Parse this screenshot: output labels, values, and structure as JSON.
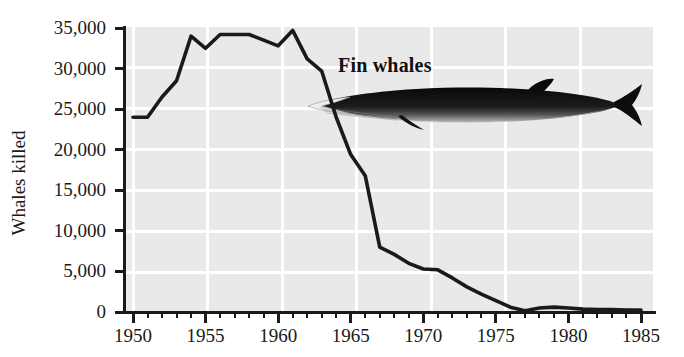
{
  "chart_data": {
    "type": "line",
    "title": "",
    "series_label": "Fin whales",
    "xlabel": "",
    "ylabel": "Whales killed",
    "xlim": [
      1949,
      1985.3
    ],
    "ylim": [
      0,
      35000
    ],
    "grid": true,
    "legend_position": "inline-annotation",
    "x_major_ticks": [
      1950,
      1955,
      1960,
      1965,
      1970,
      1975,
      1980,
      1985
    ],
    "x_tick_labels": [
      "1950",
      "1955",
      "1960",
      "1965",
      "1970",
      "1975",
      "1980",
      "1985"
    ],
    "x_minor_tick_interval": 1,
    "y_ticks": [
      0,
      5000,
      10000,
      15000,
      20000,
      25000,
      30000,
      35000
    ],
    "y_tick_labels": [
      "0",
      "5,000",
      "10,000",
      "15,000",
      "20,000",
      "25,000",
      "30,000",
      "35,000"
    ],
    "x": [
      1950,
      1951,
      1952,
      1953,
      1954,
      1955,
      1956,
      1957,
      1958,
      1959,
      1960,
      1961,
      1962,
      1963,
      1964,
      1965,
      1966,
      1967,
      1968,
      1969,
      1970,
      1971,
      1972,
      1973,
      1974,
      1975,
      1976,
      1977,
      1978,
      1979,
      1980,
      1981,
      1982,
      1983,
      1984,
      1985
    ],
    "values": [
      24000,
      24000,
      26500,
      28500,
      34000,
      32500,
      34200,
      34200,
      34200,
      33500,
      32800,
      34700,
      31200,
      29700,
      24000,
      19400,
      16800,
      8000,
      7100,
      6000,
      5300,
      5200,
      4200,
      3100,
      2200,
      1400,
      600,
      150,
      500,
      600,
      500,
      350,
      300,
      300,
      250,
      250
    ],
    "units": "whales killed per year",
    "annotations": [
      {
        "text": "Fin whales",
        "x": 1964.5,
        "y": 32000
      }
    ],
    "illustration": "fin-whale-drawing",
    "colors": {
      "line": "#1a1a1a",
      "plot_background": "#e9e9e9",
      "grid": "#ffffff",
      "axis": "#1a1a1a",
      "text": "#1a1a1a",
      "page_background": "#ffffff"
    }
  }
}
